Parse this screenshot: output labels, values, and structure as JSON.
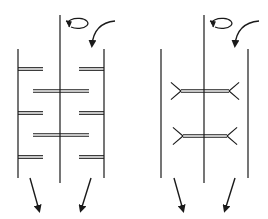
{
  "diagram": {
    "type": "mixing-vessel-schematic",
    "stroke_color": "#1a1a1a",
    "background": "#ffffff",
    "panels": [
      {
        "id": "left",
        "description": "Vessel with wall baffles and flat-blade impellers on central shaft",
        "left_wall_x": 18,
        "right_wall_x": 104,
        "wall_top_y": 49,
        "wall_bottom_y": 178,
        "shaft_x": 60,
        "shaft_top_y": 15,
        "shaft_bottom_y": 183,
        "wall_baffles": [
          {
            "side": "left",
            "y": 69,
            "x1": 18,
            "x2": 43
          },
          {
            "side": "right",
            "y": 69,
            "x1": 79,
            "x2": 104
          },
          {
            "side": "left",
            "y": 113,
            "x1": 18,
            "x2": 43
          },
          {
            "side": "right",
            "y": 113,
            "x1": 79,
            "x2": 104
          },
          {
            "side": "left",
            "y": 157,
            "x1": 18,
            "x2": 43
          },
          {
            "side": "right",
            "y": 157,
            "x1": 79,
            "x2": 104
          }
        ],
        "impellers": [
          {
            "y": 91,
            "x1": 33,
            "x2": 89
          },
          {
            "y": 135,
            "x1": 33,
            "x2": 89
          }
        ],
        "rotation_arrow": {
          "cx": 60,
          "cy": 30
        },
        "inflow_arrow": {
          "from": [
            115,
            21
          ],
          "to": [
            92,
            48
          ]
        },
        "outflow_arrows": [
          {
            "from": [
              30,
              178
            ],
            "to": [
              39,
              213
            ]
          },
          {
            "from": [
              91,
              178
            ],
            "to": [
              81,
              213
            ]
          }
        ]
      },
      {
        "id": "right",
        "description": "Vessel with pitched-blade impellers on central shaft",
        "left_wall_x": 161,
        "right_wall_x": 248,
        "wall_top_y": 49,
        "wall_bottom_y": 178,
        "shaft_x": 204,
        "shaft_top_y": 15,
        "shaft_bottom_y": 183,
        "impellers": [
          {
            "y": 91,
            "x1": 181,
            "x2": 229,
            "blade_len": 14
          },
          {
            "y": 136,
            "x1": 183,
            "x2": 227,
            "blade_len": 14
          }
        ],
        "rotation_arrow": {
          "cx": 204,
          "cy": 30
        },
        "inflow_arrow": {
          "from": [
            259,
            21
          ],
          "to": [
            235,
            48
          ]
        },
        "outflow_arrows": [
          {
            "from": [
              174,
              178
            ],
            "to": [
              183,
              213
            ]
          },
          {
            "from": [
              235,
              178
            ],
            "to": [
              225,
              213
            ]
          }
        ]
      }
    ]
  }
}
